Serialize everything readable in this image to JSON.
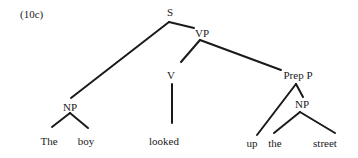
{
  "example_label": "(10c)",
  "tree": {
    "nodes": [
      {
        "id": "S",
        "label": "S"
      },
      {
        "id": "VP",
        "label": "VP"
      },
      {
        "id": "NP1",
        "label": "NP"
      },
      {
        "id": "V",
        "label": "V"
      },
      {
        "id": "PrepP",
        "label": "Prep P"
      },
      {
        "id": "NP2",
        "label": "NP"
      },
      {
        "id": "w_the1",
        "label": "The"
      },
      {
        "id": "w_boy",
        "label": "boy"
      },
      {
        "id": "w_looked",
        "label": "looked"
      },
      {
        "id": "w_up",
        "label": "up"
      },
      {
        "id": "w_the2",
        "label": "the"
      },
      {
        "id": "w_street",
        "label": "street"
      }
    ],
    "edges": [
      [
        "S",
        "NP1"
      ],
      [
        "S",
        "VP"
      ],
      [
        "VP",
        "V"
      ],
      [
        "VP",
        "PrepP"
      ],
      [
        "NP1",
        "w_the1"
      ],
      [
        "NP1",
        "w_boy"
      ],
      [
        "V",
        "w_looked"
      ],
      [
        "PrepP",
        "w_up"
      ],
      [
        "PrepP",
        "NP2"
      ],
      [
        "NP2",
        "w_the2"
      ],
      [
        "NP2",
        "w_street"
      ]
    ]
  }
}
